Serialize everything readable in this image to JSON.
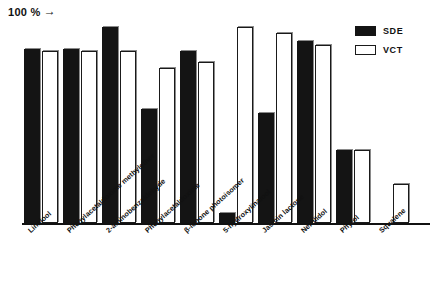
{
  "axis": {
    "hundred_percent_label": "100 %",
    "hundred_percent_arrow": "→"
  },
  "legend": {
    "items": [
      {
        "key": "sde",
        "label": "SDE",
        "color": "#141414",
        "style": "filled"
      },
      {
        "key": "vct",
        "label": "VCT",
        "color": "#ffffff",
        "style": "outline"
      }
    ]
  },
  "chart_data": {
    "type": "bar",
    "title": "",
    "subtitle": "",
    "xlabel": "",
    "ylabel": "",
    "ylim": [
      0,
      105
    ],
    "grid": false,
    "legend_position": "top-right",
    "annotations": [
      "100 % →"
    ],
    "categories": [
      "Linalool",
      "Phenylacetaldoxime methylether",
      "2-aminobenzaldehyde",
      "Phenylacetaldoxime",
      "β-ionone photoisomer",
      "5-hydroxylinalool",
      "Jasmin lactone",
      "Nerolidol",
      "Phytol",
      "Squalene"
    ],
    "series": [
      {
        "name": "SDE",
        "color": "#141414",
        "values": [
          89,
          89,
          100,
          58,
          88,
          5,
          56,
          93,
          37,
          0
        ]
      },
      {
        "name": "VCT",
        "color": "#ffffff",
        "values": [
          88,
          88,
          88,
          79,
          82,
          100,
          97,
          91,
          37,
          20
        ]
      }
    ]
  }
}
